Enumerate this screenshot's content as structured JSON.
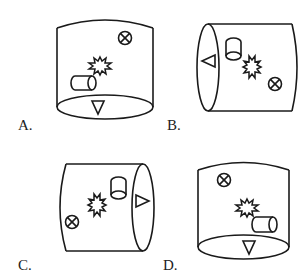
{
  "figure": {
    "type": "cylinder-view-puzzle",
    "stroke_color": "#1a1a1a",
    "background": "#ffffff"
  },
  "options": [
    {
      "label": "A.",
      "orientation": "vertical",
      "symbols": [
        "circled-x (upper right)",
        "starburst (center)",
        "small horizontal cylinder (lower left)",
        "down triangle (on bottom face)"
      ]
    },
    {
      "label": "B.",
      "orientation": "horizontal, end face left",
      "symbols": [
        "left triangle (on left end face)",
        "small vertical cylinder (upper left)",
        "starburst (center)",
        "circled-x (lower right)"
      ]
    },
    {
      "label": "C.",
      "orientation": "horizontal, end face right",
      "symbols": [
        "right triangle (on right end face)",
        "small vertical cylinder (upper right)",
        "starburst (center)",
        "circled-x (lower left)"
      ]
    },
    {
      "label": "D.",
      "orientation": "vertical",
      "symbols": [
        "circled-x (upper left)",
        "starburst (center)",
        "small horizontal cylinder (lower right)",
        "down triangle (on bottom face)"
      ]
    }
  ]
}
